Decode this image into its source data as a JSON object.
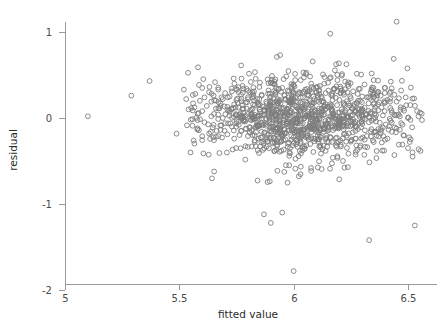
{
  "chart_data": {
    "type": "scatter",
    "title": "",
    "xlabel": "fitted value",
    "ylabel": "residual",
    "xlim": [
      4.93,
      6.62
    ],
    "ylim": [
      -2.12,
      1.25
    ],
    "grid": false,
    "legend": "none",
    "marker": {
      "shape": "open-circle",
      "radius_px": 2.4,
      "stroke": "#7d7d7d",
      "fill": "none",
      "stroke_width": 0.9
    },
    "xticks": [
      5,
      5.5,
      6,
      6.5
    ],
    "xticklabels": [
      "5",
      "5.5",
      "6",
      "6.5"
    ],
    "yticks": [
      1,
      0,
      -1,
      -2
    ],
    "yticklabels": [
      "1",
      "0",
      "-1",
      "-2"
    ],
    "n_points": 1180,
    "summary": {
      "x_mean": 6.05,
      "x_sd": 0.21,
      "residual_mean": 0.0,
      "residual_sd": 0.26,
      "x_min": 5.1,
      "x_max": 6.56,
      "residual_min": -1.78,
      "residual_max": 1.12
    },
    "notable_points": [
      {
        "x": 5.1,
        "y": 0.02,
        "note": "isolated far-left point"
      },
      {
        "x": 5.29,
        "y": 0.26,
        "note": "isolated left point"
      },
      {
        "x": 5.37,
        "y": 0.43,
        "note": "isolated left point"
      },
      {
        "x": 6.0,
        "y": -1.78,
        "note": "lowest residual outlier"
      },
      {
        "x": 6.33,
        "y": -1.42,
        "note": "low residual outlier"
      },
      {
        "x": 6.53,
        "y": -1.25,
        "note": "low residual right outlier"
      },
      {
        "x": 5.87,
        "y": -1.12,
        "note": "low residual outlier"
      },
      {
        "x": 5.95,
        "y": -1.1,
        "note": "low residual outlier"
      },
      {
        "x": 5.9,
        "y": -1.22,
        "note": "low residual outlier"
      },
      {
        "x": 6.45,
        "y": 1.12,
        "note": "highest residual outlier"
      },
      {
        "x": 6.16,
        "y": 0.98,
        "note": "high residual point"
      }
    ],
    "points": [
      [
        5.1,
        0.02
      ],
      [
        5.29,
        0.26
      ],
      [
        5.37,
        0.43
      ],
      [
        5.52,
        0.33
      ],
      [
        5.53,
        0.22
      ],
      [
        5.54,
        0.1
      ],
      [
        5.55,
        -0.02
      ],
      [
        5.56,
        0.17
      ],
      [
        5.57,
        0.28
      ],
      [
        5.58,
        0.05
      ],
      [
        5.58,
        -0.12
      ],
      [
        5.59,
        0.2
      ],
      [
        5.6,
        0.35
      ],
      [
        5.6,
        0.08
      ],
      [
        5.61,
        -0.05
      ],
      [
        5.61,
        0.24
      ],
      [
        5.62,
        0.14
      ],
      [
        5.63,
        -0.18
      ],
      [
        5.63,
        0.3
      ],
      [
        5.64,
        0.02
      ],
      [
        5.64,
        0.19
      ],
      [
        5.65,
        -0.08
      ],
      [
        5.65,
        0.26
      ],
      [
        5.66,
        0.11
      ],
      [
        5.66,
        -0.22
      ],
      [
        5.67,
        0.33
      ],
      [
        5.67,
        0.04
      ],
      [
        5.68,
        0.17
      ],
      [
        5.68,
        -0.14
      ],
      [
        5.69,
        0.22
      ],
      [
        5.69,
        0.0
      ],
      [
        5.7,
        0.29
      ],
      [
        5.7,
        -0.06
      ],
      [
        5.71,
        0.13
      ],
      [
        5.71,
        -0.19
      ],
      [
        5.72,
        0.25
      ],
      [
        5.72,
        0.07
      ],
      [
        5.73,
        -0.1
      ],
      [
        5.73,
        0.31
      ],
      [
        5.74,
        0.16
      ],
      [
        5.74,
        -0.24
      ],
      [
        5.75,
        0.03
      ],
      [
        5.75,
        0.21
      ],
      [
        5.76,
        -0.08
      ],
      [
        5.76,
        0.12
      ],
      [
        5.77,
        0.27
      ],
      [
        5.77,
        -0.15
      ],
      [
        5.78,
        0.06
      ],
      [
        5.78,
        0.34
      ],
      [
        5.79,
        -0.02
      ],
      [
        5.79,
        0.18
      ],
      [
        5.8,
        -0.21
      ],
      [
        5.8,
        0.24
      ],
      [
        5.81,
        0.09
      ],
      [
        5.81,
        -0.11
      ],
      [
        5.82,
        0.3
      ],
      [
        5.82,
        0.01
      ],
      [
        5.83,
        0.15
      ],
      [
        5.83,
        -0.26
      ],
      [
        5.84,
        0.22
      ],
      [
        5.84,
        -0.05
      ],
      [
        5.85,
        0.36
      ],
      [
        5.85,
        0.1
      ],
      [
        5.86,
        -0.16
      ],
      [
        5.86,
        0.27
      ],
      [
        5.87,
        -1.12
      ],
      [
        5.87,
        0.04
      ],
      [
        5.88,
        0.19
      ],
      [
        5.88,
        -0.09
      ],
      [
        5.89,
        0.32
      ],
      [
        5.89,
        0.13
      ],
      [
        5.9,
        -1.22
      ],
      [
        5.9,
        -0.23
      ],
      [
        5.9,
        0.25
      ],
      [
        5.91,
        0.07
      ],
      [
        5.91,
        -0.13
      ],
      [
        5.92,
        0.29
      ],
      [
        5.92,
        0.02
      ],
      [
        5.93,
        0.17
      ],
      [
        5.93,
        -0.28
      ],
      [
        5.94,
        0.21
      ],
      [
        5.94,
        -0.04
      ],
      [
        5.95,
        -1.1
      ],
      [
        5.95,
        0.35
      ],
      [
        5.95,
        0.11
      ],
      [
        5.96,
        -0.18
      ],
      [
        5.96,
        0.26
      ],
      [
        5.97,
        0.05
      ],
      [
        5.97,
        -0.07
      ],
      [
        5.98,
        0.31
      ],
      [
        5.98,
        0.14
      ],
      [
        5.99,
        -0.25
      ],
      [
        5.99,
        0.23
      ],
      [
        6.0,
        -1.78
      ],
      [
        6.0,
        -0.02
      ],
      [
        6.0,
        0.38
      ],
      [
        6.01,
        0.09
      ],
      [
        6.01,
        -0.16
      ],
      [
        6.02,
        0.28
      ],
      [
        6.02,
        0.03
      ],
      [
        6.03,
        0.18
      ],
      [
        6.03,
        -0.3
      ],
      [
        6.04,
        0.24
      ],
      [
        6.04,
        -0.06
      ],
      [
        6.05,
        0.33
      ],
      [
        6.05,
        0.12
      ],
      [
        6.06,
        -0.2
      ],
      [
        6.06,
        0.27
      ],
      [
        6.07,
        0.01
      ],
      [
        6.07,
        -0.1
      ],
      [
        6.08,
        0.36
      ],
      [
        6.08,
        0.16
      ],
      [
        6.09,
        -0.27
      ],
      [
        6.09,
        0.22
      ],
      [
        6.1,
        -0.03
      ],
      [
        6.1,
        0.3
      ],
      [
        6.11,
        0.08
      ],
      [
        6.11,
        -0.17
      ],
      [
        6.12,
        0.25
      ],
      [
        6.12,
        0.04
      ],
      [
        6.13,
        0.19
      ],
      [
        6.13,
        -0.32
      ],
      [
        6.14,
        0.29
      ],
      [
        6.14,
        -0.08
      ],
      [
        6.15,
        0.41
      ],
      [
        6.15,
        0.13
      ],
      [
        6.16,
        0.98
      ],
      [
        6.16,
        -0.22
      ],
      [
        6.17,
        0.26
      ],
      [
        6.17,
        0.0
      ],
      [
        6.18,
        -0.12
      ],
      [
        6.18,
        0.34
      ],
      [
        6.19,
        0.15
      ],
      [
        6.19,
        -0.29
      ],
      [
        6.2,
        0.21
      ],
      [
        6.2,
        -0.05
      ],
      [
        6.21,
        0.32
      ],
      [
        6.21,
        0.1
      ],
      [
        6.22,
        -0.19
      ],
      [
        6.22,
        0.27
      ],
      [
        6.23,
        0.02
      ],
      [
        6.23,
        -0.09
      ],
      [
        6.24,
        0.37
      ],
      [
        6.24,
        0.17
      ],
      [
        6.25,
        -0.26
      ],
      [
        6.25,
        0.23
      ],
      [
        6.26,
        -0.02
      ],
      [
        6.26,
        0.31
      ],
      [
        6.27,
        0.07
      ],
      [
        6.27,
        -0.15
      ],
      [
        6.28,
        0.28
      ],
      [
        6.28,
        0.05
      ],
      [
        6.29,
        0.2
      ],
      [
        6.29,
        -0.34
      ],
      [
        6.3,
        0.25
      ],
      [
        6.3,
        -0.07
      ],
      [
        6.31,
        0.39
      ],
      [
        6.31,
        0.12
      ],
      [
        6.32,
        -0.21
      ],
      [
        6.32,
        0.24
      ],
      [
        6.33,
        -1.42
      ],
      [
        6.33,
        0.01
      ],
      [
        6.34,
        -0.13
      ],
      [
        6.34,
        0.33
      ],
      [
        6.35,
        0.16
      ],
      [
        6.35,
        -0.28
      ],
      [
        6.36,
        0.22
      ],
      [
        6.36,
        -0.04
      ],
      [
        6.37,
        0.3
      ],
      [
        6.37,
        0.09
      ],
      [
        6.38,
        -0.18
      ],
      [
        6.38,
        0.26
      ],
      [
        6.39,
        0.03
      ],
      [
        6.39,
        -0.11
      ],
      [
        6.4,
        0.35
      ],
      [
        6.4,
        0.18
      ],
      [
        6.41,
        -0.24
      ],
      [
        6.41,
        0.21
      ],
      [
        6.42,
        -0.01
      ],
      [
        6.42,
        0.29
      ],
      [
        6.43,
        0.06
      ],
      [
        6.43,
        -0.16
      ],
      [
        6.44,
        0.27
      ],
      [
        6.44,
        0.04
      ],
      [
        6.45,
        1.12
      ],
      [
        6.45,
        0.19
      ],
      [
        6.46,
        -0.31
      ],
      [
        6.46,
        0.23
      ],
      [
        6.47,
        -0.06
      ],
      [
        6.47,
        0.32
      ],
      [
        6.48,
        0.11
      ],
      [
        6.48,
        -0.2
      ],
      [
        6.49,
        0.24
      ],
      [
        6.5,
        0.0
      ],
      [
        6.5,
        -0.35
      ],
      [
        6.51,
        0.15
      ],
      [
        6.52,
        -0.45
      ],
      [
        6.53,
        -1.25
      ],
      [
        6.54,
        0.08
      ],
      [
        6.56,
        0.05
      ]
    ]
  },
  "axes": {
    "x_title": "fitted value",
    "y_title": "residual"
  }
}
